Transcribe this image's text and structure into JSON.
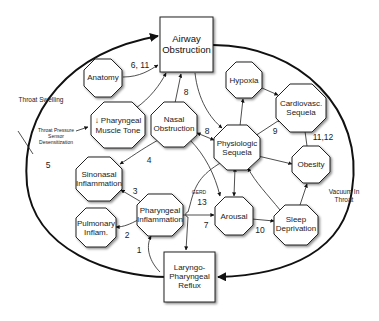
{
  "diagram": {
    "boxes": {
      "airway": {
        "line1": "Airway",
        "line2": "Obstruction"
      },
      "lpr": {
        "line1": "Laryngo-",
        "line2": "Pharyngeal",
        "line3": "Reflux"
      }
    },
    "nodes": {
      "anatomy": {
        "line1": "Anatomy"
      },
      "muscle_tone": {
        "line1": "↓ Pharyngeal",
        "line2": "Muscle Tone"
      },
      "nasal_obstruction": {
        "line1": "Nasal",
        "line2": "Obstruction"
      },
      "hypoxia": {
        "line1": "Hypoxia"
      },
      "cardiovasc": {
        "line1": "Cardiovasc.",
        "line2": "Sequela"
      },
      "physiologic": {
        "line1": "Physiologic",
        "line2": "Sequela"
      },
      "obesity": {
        "line1": "Obesity"
      },
      "sinonasal": {
        "line1": "Sinonasal",
        "line2": "Inflammation"
      },
      "pharyngeal_inflammation": {
        "line1": "Pharyngeal",
        "line2": "Inflammation"
      },
      "pulmonary": {
        "line1": "Pulmonary",
        "line2": "Inflam."
      },
      "arousal": {
        "line1": "Arousal"
      },
      "sleep_deprivation": {
        "line1": "Sleep",
        "line2": "Deprivation"
      }
    },
    "edge_labels": {
      "anatomy_airway": "6, 11",
      "nasal_airway": "8",
      "nasal_physiologic": "8",
      "physiologic_cardiovasc": "9",
      "obesity_cardiovasc": "11,12",
      "nasal_sinonasal": "4",
      "pharyngeal_sinonasal": "3",
      "pharyngeal_pulmonary": "2",
      "lpr_pharyngeal": "1",
      "pharyngeal_arousal": "7",
      "gerd": "GERD",
      "gerd_num": "13",
      "arousal_sleep": "10",
      "outer_left": "5"
    },
    "side_labels": {
      "throat_swelling": "Throat Swelling",
      "sensor_line1": "Throat Pressure",
      "sensor_line2": "Sensor",
      "sensor_line3": "Desensitization",
      "vacuum_line1": "Vacuum In",
      "vacuum_line2": "Throat"
    }
  }
}
